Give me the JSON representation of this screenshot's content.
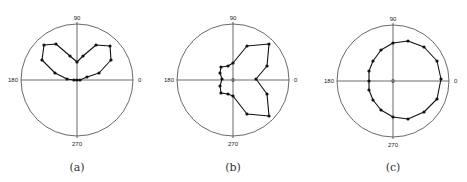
{
  "figure": {
    "panels": [
      {
        "id": "a",
        "caption": "(a)",
        "cx": 77,
        "cy": 80,
        "r": 56,
        "show_origin_label": false
      },
      {
        "id": "b",
        "caption": "(b)",
        "cx": 233,
        "cy": 80,
        "r": 56,
        "show_origin_label": true
      },
      {
        "id": "c",
        "caption": "(c)",
        "cx": 393,
        "cy": 81,
        "r": 56,
        "show_origin_label": true
      }
    ],
    "angle_labels": {
      "top": "90",
      "left": "180",
      "right": "0",
      "bottom": "270",
      "origin": "0"
    },
    "colors": {
      "line": "#111111",
      "axis": "#444444",
      "circle": "#444444"
    }
  },
  "chart_data": [
    {
      "type": "line",
      "subtype": "polar",
      "title": "(a)",
      "angle_ticks": [
        0,
        90,
        180,
        270
      ],
      "grid": false,
      "points_px": [
        [
          77,
          62
        ],
        [
          83,
          56
        ],
        [
          96,
          45
        ],
        [
          110,
          46
        ],
        [
          111,
          60
        ],
        [
          99,
          73
        ],
        [
          87,
          77
        ],
        [
          80,
          80
        ],
        [
          77,
          80
        ],
        [
          74,
          80
        ],
        [
          67,
          79
        ],
        [
          55,
          73
        ],
        [
          42,
          60
        ],
        [
          44,
          45
        ],
        [
          56,
          44
        ],
        [
          70,
          56
        ]
      ],
      "description": "Two-lobed (heart/butterfly) shape in upper half, lobes peaking near 45 and 135 degrees"
    },
    {
      "type": "line",
      "subtype": "polar",
      "title": "(b)",
      "angle_ticks": [
        0,
        90,
        180,
        270
      ],
      "grid": false,
      "points_px": [
        [
          233,
          63
        ],
        [
          247,
          46
        ],
        [
          269,
          44
        ],
        [
          267,
          66
        ],
        [
          256,
          79
        ],
        [
          267,
          94
        ],
        [
          269,
          116
        ],
        [
          247,
          114
        ],
        [
          233,
          96
        ],
        [
          228,
          94
        ],
        [
          221,
          93
        ],
        [
          220,
          86
        ],
        [
          222,
          79
        ],
        [
          220,
          73
        ],
        [
          221,
          67
        ],
        [
          228,
          66
        ]
      ],
      "description": "Two-lobed shape extending to the right, lobes near 30 and 330 degrees"
    },
    {
      "type": "line",
      "subtype": "polar",
      "title": "(c)",
      "angle_ticks": [
        0,
        90,
        180,
        270
      ],
      "grid": false,
      "points_px": [
        [
          393,
          43
        ],
        [
          408,
          41
        ],
        [
          424,
          47
        ],
        [
          437,
          61
        ],
        [
          441,
          79
        ],
        [
          437,
          99
        ],
        [
          424,
          112
        ],
        [
          408,
          119
        ],
        [
          393,
          117
        ],
        [
          381,
          110
        ],
        [
          373,
          100
        ],
        [
          369,
          90
        ],
        [
          369,
          81
        ],
        [
          369,
          71
        ],
        [
          373,
          61
        ],
        [
          381,
          50
        ]
      ],
      "description": "Nearly circular pattern offset toward 0 degrees"
    }
  ]
}
